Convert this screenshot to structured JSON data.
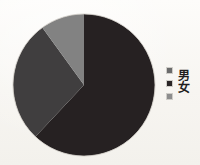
{
  "chart_data": {
    "type": "pie",
    "title": "",
    "subtitle": "",
    "xlabel": "",
    "ylabel": "",
    "grid": false,
    "legend_position": "right",
    "categories": [
      "男",
      "女",
      ""
    ],
    "labels": [
      "男",
      "女",
      ""
    ],
    "values": [
      62,
      28,
      10
    ],
    "units": "percent",
    "slices": [
      {
        "label": "男",
        "value": 62,
        "color": "#262122",
        "start_angle_deg": 118,
        "end_angle_deg": 360
      },
      {
        "label": "女",
        "value": 28,
        "color": "#403e3f",
        "start_angle_deg": 0,
        "end_angle_deg": 100
      },
      {
        "label": "",
        "value": 10,
        "color": "#828282",
        "start_angle_deg": 100,
        "end_angle_deg": 118
      }
    ],
    "colors": [
      "#262122",
      "#403e3f",
      "#828282"
    ],
    "annotations": []
  },
  "legend": {
    "title": "",
    "items": [
      {
        "marker": "legend-swatch-icon",
        "label": "",
        "color": "#6b6b6b"
      },
      {
        "marker": "legend-swatch-icon",
        "label": "男",
        "color": "#2a2526"
      },
      {
        "marker": "legend-swatch-icon",
        "label": "女",
        "color": "#8d8d8d"
      }
    ],
    "labels": [
      "男",
      "女"
    ]
  },
  "page": {
    "background_color": "#fbfaf7",
    "ink_color": "#211d1e"
  }
}
